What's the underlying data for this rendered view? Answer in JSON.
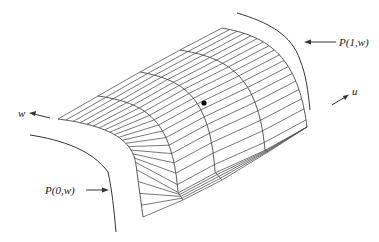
{
  "diagram": {
    "type": "parametric-surface-patch",
    "labels": {
      "p1": "P(1,w)",
      "p0": "P(0,w)",
      "w_axis": "w",
      "u_axis": "u"
    },
    "colors": {
      "mesh": "#555555",
      "curve": "#333333",
      "point": "#000000",
      "background": "#ffffff"
    },
    "mesh": {
      "u_sections": 5,
      "w_lines": 22
    },
    "point": {
      "x": 204,
      "y": 103
    }
  }
}
